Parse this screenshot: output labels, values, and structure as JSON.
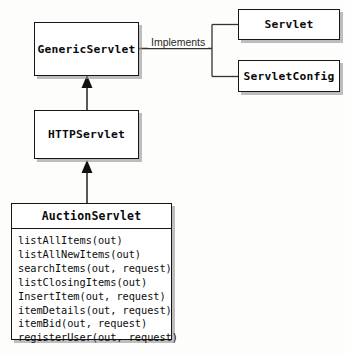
{
  "diagram": {
    "kind": "uml-class-diagram",
    "background_color": "#fdfdfb",
    "line_color": "#333333",
    "border_color": "#161616",
    "shadow_color": "#969696"
  },
  "nodes": {
    "servlet": {
      "name": "Servlet"
    },
    "servlet_config": {
      "name": "ServletConfig"
    },
    "generic_servlet": {
      "name": "GenericServlet"
    },
    "http_servlet": {
      "name": "HTTPServlet"
    },
    "auction_servlet": {
      "name": "AuctionServlet",
      "methods": [
        "listAllItems(out)",
        "listAllNewItems(out)",
        "searchItems(out, request)",
        "listClosingItems(out)",
        "InsertItem(out, request)",
        "itemDetails(out, request)",
        "itemBid(out, request)",
        "registerUser(out, request)"
      ]
    }
  },
  "edges": {
    "implements_label": "Implements"
  }
}
